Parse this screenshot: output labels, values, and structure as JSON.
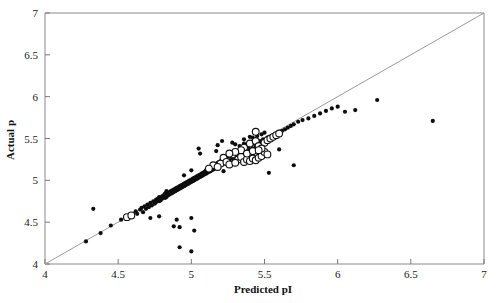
{
  "chart_data": {
    "type": "scatter",
    "title": "",
    "xlabel": "Predicted pI",
    "ylabel": "Actual p",
    "xlim": [
      4,
      7
    ],
    "ylim": [
      4,
      7
    ],
    "xticks": [
      "4",
      "4.5",
      "5",
      "5.5",
      "6",
      "6.5",
      "7"
    ],
    "yticks": [
      "4",
      "4.5",
      "5",
      "5.5",
      "6",
      "6.5",
      "7"
    ],
    "xtick_values": [
      4,
      4.5,
      5,
      5.5,
      6,
      6.5,
      7
    ],
    "ytick_values": [
      4,
      4.5,
      5,
      5.5,
      6,
      6.5,
      7
    ],
    "grid": false,
    "legend": "none",
    "reference_line": {
      "name": "identity-line",
      "type": "line",
      "from": [
        4,
        4
      ],
      "to": [
        7,
        7
      ],
      "color": "#9a9a9a"
    },
    "series": [
      {
        "name": "filled-points",
        "marker": "filled-circle",
        "color": "#0d0d0d",
        "points": [
          [
            4.28,
            4.27
          ],
          [
            4.33,
            4.66
          ],
          [
            4.38,
            4.37
          ],
          [
            4.45,
            4.46
          ],
          [
            4.52,
            4.53
          ],
          [
            4.55,
            4.56
          ],
          [
            4.58,
            4.58
          ],
          [
            4.62,
            4.63
          ],
          [
            4.63,
            4.6
          ],
          [
            4.65,
            4.65
          ],
          [
            4.66,
            4.67
          ],
          [
            4.67,
            4.62
          ],
          [
            4.68,
            4.69
          ],
          [
            4.69,
            4.66
          ],
          [
            4.7,
            4.71
          ],
          [
            4.71,
            4.68
          ],
          [
            4.72,
            4.73
          ],
          [
            4.73,
            4.7
          ],
          [
            4.74,
            4.75
          ],
          [
            4.75,
            4.72
          ],
          [
            4.76,
            4.77
          ],
          [
            4.76,
            4.74
          ],
          [
            4.77,
            4.78
          ],
          [
            4.78,
            4.75
          ],
          [
            4.78,
            4.8
          ],
          [
            4.79,
            4.76
          ],
          [
            4.8,
            4.81
          ],
          [
            4.8,
            4.78
          ],
          [
            4.81,
            4.82
          ],
          [
            4.82,
            4.79
          ],
          [
            4.82,
            4.84
          ],
          [
            4.83,
            4.8
          ],
          [
            4.84,
            4.85
          ],
          [
            4.84,
            4.82
          ],
          [
            4.85,
            4.86
          ],
          [
            4.85,
            4.83
          ],
          [
            4.86,
            4.87
          ],
          [
            4.86,
            4.84
          ],
          [
            4.87,
            4.88
          ],
          [
            4.87,
            4.85
          ],
          [
            4.88,
            4.89
          ],
          [
            4.88,
            4.86
          ],
          [
            4.89,
            4.9
          ],
          [
            4.89,
            4.87
          ],
          [
            4.9,
            4.91
          ],
          [
            4.9,
            4.88
          ],
          [
            4.91,
            4.92
          ],
          [
            4.91,
            4.89
          ],
          [
            4.92,
            4.93
          ],
          [
            4.92,
            4.9
          ],
          [
            4.93,
            4.94
          ],
          [
            4.93,
            4.91
          ],
          [
            4.94,
            4.95
          ],
          [
            4.94,
            4.92
          ],
          [
            4.95,
            4.96
          ],
          [
            4.95,
            4.93
          ],
          [
            4.96,
            4.97
          ],
          [
            4.96,
            4.94
          ],
          [
            4.97,
            4.98
          ],
          [
            4.97,
            4.95
          ],
          [
            4.98,
            4.99
          ],
          [
            4.98,
            4.96
          ],
          [
            4.99,
            5.0
          ],
          [
            4.99,
            4.97
          ],
          [
            5.0,
            5.01
          ],
          [
            5.0,
            4.98
          ],
          [
            5.01,
            5.02
          ],
          [
            5.01,
            4.99
          ],
          [
            5.02,
            5.03
          ],
          [
            5.02,
            5.0
          ],
          [
            5.03,
            5.04
          ],
          [
            5.03,
            5.01
          ],
          [
            5.04,
            5.05
          ],
          [
            5.04,
            5.02
          ],
          [
            5.05,
            5.06
          ],
          [
            5.05,
            5.03
          ],
          [
            5.06,
            5.07
          ],
          [
            5.06,
            5.04
          ],
          [
            5.07,
            5.08
          ],
          [
            5.07,
            5.05
          ],
          [
            5.08,
            5.09
          ],
          [
            5.08,
            5.06
          ],
          [
            5.09,
            5.1
          ],
          [
            5.09,
            5.07
          ],
          [
            5.1,
            5.12
          ],
          [
            5.1,
            5.08
          ],
          [
            5.11,
            5.13
          ],
          [
            5.11,
            5.09
          ],
          [
            5.12,
            5.14
          ],
          [
            5.12,
            5.1
          ],
          [
            5.13,
            5.15
          ],
          [
            5.13,
            5.11
          ],
          [
            5.14,
            5.16
          ],
          [
            5.14,
            5.12
          ],
          [
            5.15,
            5.17
          ],
          [
            5.15,
            5.13
          ],
          [
            5.16,
            5.18
          ],
          [
            5.16,
            5.14
          ],
          [
            5.17,
            5.19
          ],
          [
            5.17,
            5.15
          ],
          [
            5.18,
            5.21
          ],
          [
            5.18,
            5.16
          ],
          [
            5.19,
            5.22
          ],
          [
            5.19,
            5.17
          ],
          [
            5.2,
            5.23
          ],
          [
            5.2,
            5.18
          ],
          [
            5.21,
            5.24
          ],
          [
            5.21,
            5.19
          ],
          [
            5.22,
            5.25
          ],
          [
            5.22,
            5.2
          ],
          [
            5.23,
            5.26
          ],
          [
            5.23,
            5.21
          ],
          [
            5.24,
            5.28
          ],
          [
            5.24,
            5.22
          ],
          [
            5.25,
            5.29
          ],
          [
            5.25,
            5.23
          ],
          [
            5.26,
            5.3
          ],
          [
            5.26,
            5.24
          ],
          [
            5.27,
            5.31
          ],
          [
            5.28,
            5.26
          ],
          [
            5.29,
            5.33
          ],
          [
            5.3,
            5.28
          ],
          [
            5.31,
            5.34
          ],
          [
            5.32,
            5.3
          ],
          [
            5.33,
            5.36
          ],
          [
            5.34,
            5.32
          ],
          [
            5.35,
            5.37
          ],
          [
            5.36,
            5.33
          ],
          [
            5.37,
            5.39
          ],
          [
            5.38,
            5.35
          ],
          [
            5.39,
            5.4
          ],
          [
            5.4,
            5.36
          ],
          [
            5.41,
            5.42
          ],
          [
            5.42,
            5.38
          ],
          [
            5.43,
            5.44
          ],
          [
            5.44,
            5.4
          ],
          [
            5.45,
            5.46
          ],
          [
            5.46,
            5.42
          ],
          [
            5.47,
            5.47
          ],
          [
            5.48,
            5.44
          ],
          [
            5.49,
            5.49
          ],
          [
            5.5,
            5.46
          ],
          [
            5.52,
            5.51
          ],
          [
            5.54,
            5.48
          ],
          [
            5.56,
            5.53
          ],
          [
            5.58,
            5.55
          ],
          [
            5.6,
            5.57
          ],
          [
            5.62,
            5.59
          ],
          [
            5.64,
            5.61
          ],
          [
            5.66,
            5.63
          ],
          [
            5.68,
            5.65
          ],
          [
            5.7,
            5.67
          ],
          [
            5.73,
            5.7
          ],
          [
            5.76,
            5.72
          ],
          [
            5.8,
            5.74
          ],
          [
            5.84,
            5.77
          ],
          [
            5.88,
            5.8
          ],
          [
            5.92,
            5.83
          ],
          [
            5.96,
            5.86
          ],
          [
            6.0,
            5.88
          ],
          [
            6.05,
            5.82
          ],
          [
            6.12,
            5.84
          ],
          [
            6.27,
            5.96
          ],
          [
            6.65,
            5.71
          ],
          [
            5.05,
            5.38
          ],
          [
            5.18,
            5.42
          ],
          [
            5.3,
            5.43
          ],
          [
            5.42,
            5.3
          ],
          [
            4.88,
            4.45
          ],
          [
            4.92,
            4.44
          ],
          [
            4.9,
            4.53
          ],
          [
            5.0,
            4.55
          ],
          [
            4.92,
            4.2
          ],
          [
            5.0,
            4.15
          ],
          [
            5.02,
            4.4
          ],
          [
            5.0,
            5.12
          ],
          [
            5.22,
            5.11
          ],
          [
            5.7,
            5.18
          ],
          [
            5.6,
            5.37
          ],
          [
            5.53,
            5.09
          ],
          [
            4.56,
            4.56
          ],
          [
            4.6,
            4.59
          ],
          [
            4.83,
            4.87
          ],
          [
            5.06,
            5.32
          ],
          [
            5.21,
            5.47
          ],
          [
            5.36,
            5.49
          ],
          [
            5.4,
            5.52
          ],
          [
            5.48,
            5.55
          ],
          [
            5.5,
            5.57
          ],
          [
            5.28,
            5.45
          ],
          [
            5.17,
            5.35
          ],
          [
            4.95,
            5.06
          ],
          [
            5.42,
            5.51
          ],
          [
            5.45,
            5.53
          ],
          [
            5.36,
            5.44
          ],
          [
            5.33,
            5.41
          ],
          [
            4.72,
            4.55
          ],
          [
            4.78,
            4.57
          ]
        ]
      },
      {
        "name": "open-points",
        "marker": "open-circle",
        "color": "#111111",
        "points": [
          [
            4.56,
            4.56
          ],
          [
            4.59,
            4.58
          ],
          [
            5.22,
            5.27
          ],
          [
            5.28,
            5.31
          ],
          [
            5.32,
            5.25
          ],
          [
            5.34,
            5.28
          ],
          [
            5.36,
            5.22
          ],
          [
            5.38,
            5.25
          ],
          [
            5.4,
            5.23
          ],
          [
            5.42,
            5.26
          ],
          [
            5.44,
            5.24
          ],
          [
            5.46,
            5.27
          ],
          [
            5.48,
            5.29
          ],
          [
            5.2,
            5.2
          ],
          [
            5.24,
            5.22
          ],
          [
            5.26,
            5.19
          ],
          [
            5.3,
            5.21
          ],
          [
            5.15,
            5.18
          ],
          [
            5.18,
            5.16
          ],
          [
            5.12,
            5.14
          ],
          [
            5.36,
            5.39
          ],
          [
            5.4,
            5.44
          ],
          [
            5.44,
            5.47
          ],
          [
            5.46,
            5.41
          ],
          [
            5.5,
            5.45
          ],
          [
            5.52,
            5.48
          ],
          [
            5.54,
            5.5
          ],
          [
            5.56,
            5.52
          ],
          [
            5.58,
            5.54
          ],
          [
            5.6,
            5.56
          ],
          [
            5.44,
            5.58
          ],
          [
            5.5,
            5.34
          ],
          [
            5.52,
            5.31
          ],
          [
            5.34,
            5.36
          ],
          [
            5.3,
            5.34
          ],
          [
            5.26,
            5.32
          ],
          [
            5.38,
            5.32
          ],
          [
            5.42,
            5.35
          ],
          [
            5.48,
            5.38
          ],
          [
            5.46,
            5.36
          ]
        ]
      }
    ]
  }
}
